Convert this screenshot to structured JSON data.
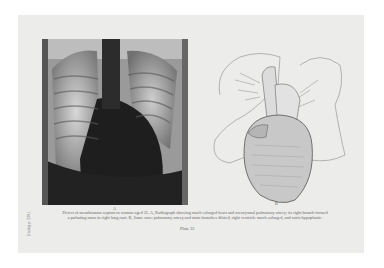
{
  "figure": {
    "panel_a_label": "A",
    "panel_b_label": "B",
    "caption_line1": "Defect of membranous septum in woman aged 35. A, Radiograph showing much enlarged heart and aneurysmal pulmonary artery; its right branch formed",
    "caption_line2": "a pulsating mass in right lung root. B, Same case: pulmonary artery and main branches dilated, right ventricle much enlarged, and aorta hypoplastic.",
    "plate_label": "Plate 32",
    "side_text": "[facing p. 229]",
    "panel_a_description": "Chest X-ray radiograph",
    "panel_b_description": "Pencil drawing of enlarged heart with lungs outlined"
  }
}
